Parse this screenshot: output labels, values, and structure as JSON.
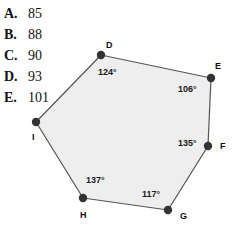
{
  "question": {
    "choices": [
      {
        "letter": "A.",
        "value": "85"
      },
      {
        "letter": "B.",
        "value": "88"
      },
      {
        "letter": "C.",
        "value": "90"
      },
      {
        "letter": "D.",
        "value": "93"
      },
      {
        "letter": "E.",
        "value": "101"
      }
    ]
  },
  "figure": {
    "shape": "hexagon",
    "fill_color": "#eeeeee",
    "stroke_color": "#555555",
    "vertex_color": "#333333",
    "vertices": [
      {
        "name": "D",
        "x": 101,
        "y": 55,
        "label_x": 106,
        "label_y": 41
      },
      {
        "name": "E",
        "x": 211,
        "y": 78,
        "label_x": 215,
        "label_y": 62
      },
      {
        "name": "F",
        "x": 208,
        "y": 146,
        "label_x": 220,
        "label_y": 142
      },
      {
        "name": "G",
        "x": 168,
        "y": 210,
        "label_x": 180,
        "label_y": 212
      },
      {
        "name": "H",
        "x": 83,
        "y": 198,
        "label_x": 80,
        "label_y": 211
      },
      {
        "name": "I",
        "x": 36,
        "y": 122,
        "label_x": 32,
        "label_y": 133
      }
    ],
    "angles": [
      {
        "vertex": "D",
        "text": "124°",
        "x": 98,
        "y": 68
      },
      {
        "vertex": "E",
        "text": "106°",
        "x": 178,
        "y": 85
      },
      {
        "vertex": "F",
        "text": "135°",
        "x": 178,
        "y": 139
      },
      {
        "vertex": "H",
        "text": "137°",
        "x": 86,
        "y": 176
      },
      {
        "vertex": "G",
        "text": "117°",
        "x": 142,
        "y": 190
      }
    ]
  }
}
